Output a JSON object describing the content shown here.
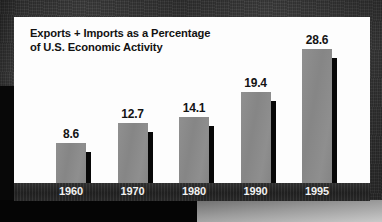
{
  "chart_data": {
    "type": "bar",
    "title": "Exports + Imports as a Percentage of U.S. Economic Activity",
    "title_line1": "Exports + Imports as a Percentage",
    "title_line2": "of U.S. Economic Activity",
    "xlabel": "",
    "ylabel": "",
    "ylim": [
      0,
      30
    ],
    "grid": false,
    "legend": "none",
    "categories": [
      "1960",
      "1970",
      "1980",
      "1990",
      "1995"
    ],
    "values": [
      8.6,
      12.7,
      14.1,
      19.4,
      28.6
    ],
    "value_labels": [
      "8.6",
      "12.7",
      "14.1",
      "19.4",
      "28.6"
    ],
    "series": [
      {
        "name": "Exports + Imports as a Percentage of U.S. Economic Activity",
        "values": [
          8.6,
          12.7,
          14.1,
          19.4,
          28.6
        ]
      }
    ],
    "units": "percent",
    "bar_color": "#8a8a8a",
    "bar_shadow_color": "#080808",
    "panel_color": "#fdfdfd",
    "axis_band_color": "#2a2a2a",
    "axis_label_color": "#f2f2f2",
    "value_label_color": "#141414",
    "title_color": "#121212",
    "background_color": "#3a3a3a"
  },
  "bars": [
    {
      "category": "1960",
      "value": 8.6,
      "label": "8.6"
    },
    {
      "category": "1970",
      "value": 12.7,
      "label": "12.7"
    },
    {
      "category": "1980",
      "value": 14.1,
      "label": "14.1"
    },
    {
      "category": "1990",
      "value": 19.4,
      "label": "19.4"
    },
    {
      "category": "1995",
      "value": 28.6,
      "label": "28.6"
    }
  ]
}
